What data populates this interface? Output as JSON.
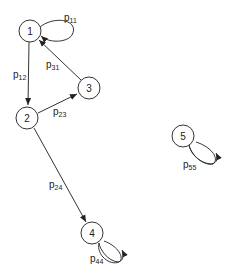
{
  "diagram": {
    "type": "markov-chain-state-diagram",
    "nodes": [
      {
        "id": "1",
        "label": "1"
      },
      {
        "id": "2",
        "label": "2"
      },
      {
        "id": "3",
        "label": "3"
      },
      {
        "id": "4",
        "label": "4"
      },
      {
        "id": "5",
        "label": "5"
      }
    ],
    "edges": [
      {
        "from": "1",
        "to": "1",
        "label_main": "p",
        "label_sub": "11"
      },
      {
        "from": "1",
        "to": "2",
        "label_main": "p",
        "label_sub": "12"
      },
      {
        "from": "3",
        "to": "1",
        "label_main": "p",
        "label_sub": "31"
      },
      {
        "from": "2",
        "to": "3",
        "label_main": "p",
        "label_sub": "23"
      },
      {
        "from": "2",
        "to": "4",
        "label_main": "p",
        "label_sub": "24"
      },
      {
        "from": "4",
        "to": "4",
        "label_main": "p",
        "label_sub": "44"
      },
      {
        "from": "5",
        "to": "5",
        "label_main": "p",
        "label_sub": "55"
      }
    ],
    "colors": {
      "stroke": "#333333",
      "text": "#222222",
      "background": "#ffffff"
    }
  }
}
